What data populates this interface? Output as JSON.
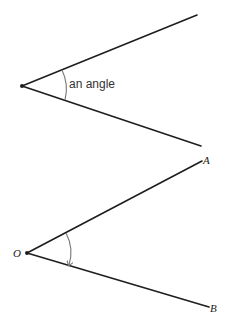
{
  "diagram_1": {
    "label": "an angle",
    "vertex": [
      22,
      86
    ],
    "ray_upper_end": [
      197,
      15
    ],
    "ray_lower_end": [
      201,
      146
    ]
  },
  "diagram_2": {
    "vertex_label": "O",
    "point_a_label": "A",
    "point_b_label": "B",
    "vertex": [
      27,
      253
    ],
    "ray_a_end": [
      202,
      161
    ],
    "ray_b_end": [
      209,
      307
    ],
    "arc_direction": "from OA to OB (clockwise arrow)"
  },
  "colors": {
    "line": "#1e1e1e",
    "arc": "#777777",
    "background": "#ffffff"
  }
}
